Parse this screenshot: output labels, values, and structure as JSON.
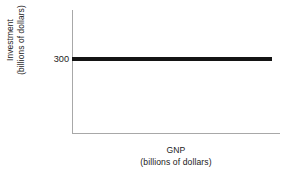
{
  "chart_data": {
    "type": "line",
    "title": "",
    "subtitle": "",
    "xlabel": "GNP",
    "xlabel_units": "(billions of dollars)",
    "ylabel": "Investment",
    "ylabel_units": "(billions of dollars)",
    "series": [
      {
        "name": "Investment",
        "x": [
          0,
          100
        ],
        "values": [
          300,
          300
        ],
        "color": "#141414",
        "line_width_px": 4,
        "style": "solid"
      }
    ],
    "x_ticks": [],
    "x_tick_labels": [],
    "y_ticks": [
      300
    ],
    "y_tick_labels": [
      "300"
    ],
    "xlim": [
      0,
      100
    ],
    "ylim": [
      0,
      500
    ],
    "grid": false,
    "legend": false,
    "legend_position": "none",
    "annotations": [],
    "axis_color": "#a8a8a8",
    "background_color": "#ffffff"
  },
  "axes": {
    "y_title_line1": "Investment",
    "y_title_line2": "(billions of dollars)",
    "x_title_line1": "GNP",
    "x_title_line2": "(billions of dollars)",
    "y_tick_300": "300"
  }
}
